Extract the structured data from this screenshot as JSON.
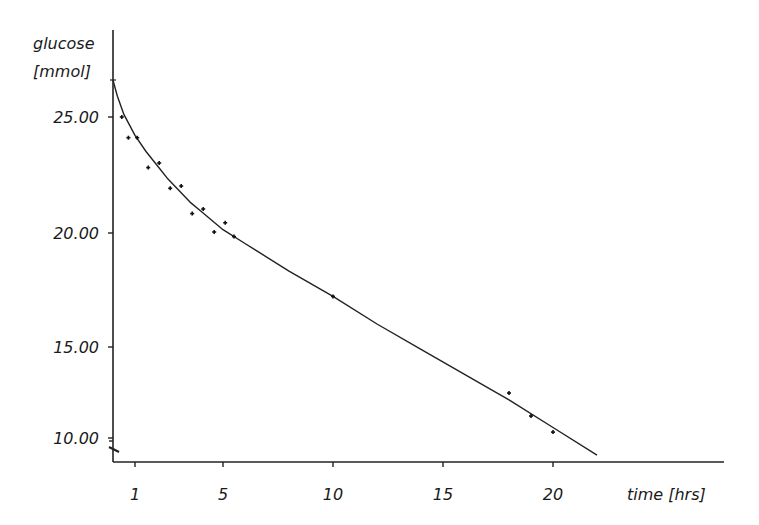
{
  "chart_data": {
    "type": "scatter",
    "title": "",
    "ylabel_line1": "glucose",
    "ylabel_line2": "[mmol]",
    "xlabel": "time [hrs]",
    "x_ticks": [
      1,
      5,
      10,
      15,
      20
    ],
    "x_tick_labels": [
      "1",
      "5",
      "10",
      "15",
      "20"
    ],
    "y_ticks": [
      25,
      20,
      15,
      10
    ],
    "y_tick_labels": [
      "25.00",
      "20.00",
      "15.00",
      "10.00"
    ],
    "xlim": [
      0,
      27
    ],
    "ylim": [
      9,
      28
    ],
    "grid": false,
    "legend": "none",
    "axis_break_y": true,
    "series": [
      {
        "name": "measurements",
        "kind": "points",
        "x": [
          0.4,
          0.7,
          1.1,
          1.6,
          2.1,
          2.6,
          3.1,
          3.6,
          4.1,
          4.6,
          5.1,
          5.5,
          10.0,
          18.0,
          19.0,
          20.0
        ],
        "y": [
          25.0,
          24.1,
          24.1,
          22.8,
          23.0,
          21.9,
          22.0,
          20.8,
          21.0,
          20.0,
          20.4,
          19.8,
          17.2,
          13.0,
          12.0,
          11.3
        ]
      },
      {
        "name": "fitted curve",
        "kind": "line",
        "x": [
          0,
          0.2,
          0.5,
          1,
          1.5,
          2,
          2.5,
          3,
          3.5,
          4,
          4.5,
          5,
          6,
          8,
          10,
          12,
          14,
          16,
          18,
          20,
          22
        ],
        "y": [
          26.6,
          25.9,
          25.1,
          24.2,
          23.5,
          22.9,
          22.3,
          21.8,
          21.3,
          20.9,
          20.5,
          20.1,
          19.5,
          18.3,
          17.2,
          16.0,
          14.9,
          13.8,
          12.7,
          11.5,
          10.3
        ]
      }
    ]
  }
}
